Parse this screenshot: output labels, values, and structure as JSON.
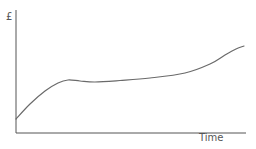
{
  "chart_data": {
    "type": "line",
    "title": "",
    "xlabel": "Time",
    "ylabel": "£",
    "grid": false,
    "legend": null,
    "ticks": {
      "x": [],
      "y": []
    },
    "series": [
      {
        "name": "value",
        "color": "#6a6a6a",
        "points_px": [
          [
            16,
            119
          ],
          [
            30,
            104
          ],
          [
            45,
            91
          ],
          [
            58,
            83
          ],
          [
            68,
            80
          ],
          [
            80,
            81
          ],
          [
            95,
            82
          ],
          [
            120,
            80.5
          ],
          [
            150,
            78
          ],
          [
            185,
            73
          ],
          [
            210,
            64
          ],
          [
            225,
            55
          ],
          [
            236,
            49
          ],
          [
            244,
            46
          ]
        ]
      }
    ],
    "axes": {
      "x_from": 16,
      "x_to": 246,
      "y_from": 10,
      "y_to": 133,
      "color": "#555555"
    }
  }
}
